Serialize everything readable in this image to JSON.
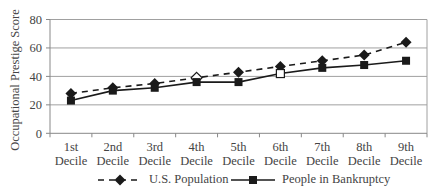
{
  "chart_data": {
    "type": "line",
    "title": "",
    "xlabel": "",
    "ylabel": "Occupational Prestige Score",
    "ylim": [
      0,
      80
    ],
    "yticks": [
      0,
      20,
      40,
      60,
      80
    ],
    "grid": true,
    "legend_position": "bottom",
    "categories": [
      "1st Decile",
      "2nd Decile",
      "3rd Decile",
      "4th Decile",
      "5th Decile",
      "6th Decile",
      "7th Decile",
      "8th Decile",
      "9th Decile"
    ],
    "category_lines": [
      [
        "1st",
        "Decile"
      ],
      [
        "2nd",
        "Decile"
      ],
      [
        "3rd",
        "Decile"
      ],
      [
        "4th",
        "Decile"
      ],
      [
        "5th",
        "Decile"
      ],
      [
        "6th",
        "Decile"
      ],
      [
        "7th",
        "Decile"
      ],
      [
        "8th",
        "Decile"
      ],
      [
        "9th",
        "Decile"
      ]
    ],
    "series": [
      {
        "name": "U.S. Population",
        "style": "dashed",
        "marker": "diamond",
        "color": "#1a1a1a",
        "values": [
          28,
          32,
          35,
          39,
          43,
          47,
          51,
          55,
          64
        ]
      },
      {
        "name": "People in Bankruptcy",
        "style": "solid",
        "marker": "square",
        "color": "#1a1a1a",
        "values": [
          23,
          30,
          32,
          36,
          36,
          42,
          46,
          48,
          51
        ]
      }
    ]
  },
  "legend": {
    "items": [
      {
        "label": "U.S. Population"
      },
      {
        "label": "People in Bankruptcy"
      }
    ]
  },
  "axis": {
    "ylabel": "Occupational Prestige Score"
  },
  "colors": {
    "grid": "#a0a0a0",
    "axis": "#888888",
    "series": "#1a1a1a",
    "text": "#444444"
  }
}
